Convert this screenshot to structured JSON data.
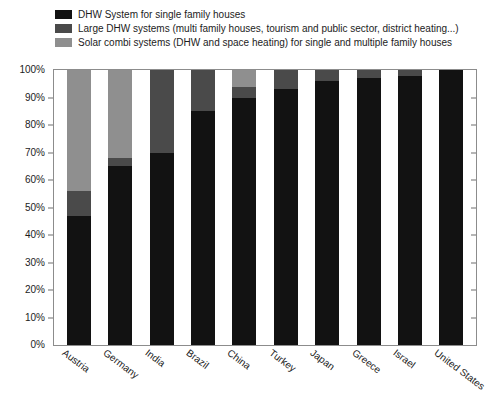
{
  "chart_data": {
    "type": "bar",
    "stacked": true,
    "title": "",
    "subtitle": "",
    "xlabel": "",
    "ylabel": "",
    "ylim": [
      0,
      100
    ],
    "yticks": [
      "0%",
      "10%",
      "20%",
      "30%",
      "40%",
      "50%",
      "60%",
      "70%",
      "80%",
      "90%",
      "100%"
    ],
    "ytick_values": [
      0,
      10,
      20,
      30,
      40,
      50,
      60,
      70,
      80,
      90,
      100
    ],
    "grid": false,
    "legend_position": "top",
    "categories": [
      "Austria",
      "Germany",
      "India",
      "Brazil",
      "China",
      "Turkey",
      "Japan",
      "Greece",
      "Israel",
      "United States"
    ],
    "series": [
      {
        "name": "DHW System for single family houses",
        "color": "#121212",
        "values": [
          47,
          65,
          70,
          85,
          90,
          93,
          96,
          97,
          98,
          100
        ]
      },
      {
        "name": "Large DHW systems (multi family houses, tourism and public sector, district heating...)",
        "color": "#4a4a4a",
        "values": [
          9,
          3,
          30,
          15,
          4,
          7,
          4,
          3,
          2,
          0
        ]
      },
      {
        "name": "Solar combi systems (DHW and space heating) for single and multiple family houses",
        "color": "#8f8f8f",
        "values": [
          44,
          32,
          0,
          0,
          6,
          0,
          0,
          0,
          0,
          0
        ]
      }
    ]
  },
  "legend": {
    "items": [
      {
        "label": "DHW System for single family houses",
        "color": "#121212"
      },
      {
        "label": "Large DHW systems (multi family houses, tourism and public sector, district heating...)",
        "color": "#4a4a4a"
      },
      {
        "label": "Solar combi systems (DHW and space heating) for single and multiple family houses",
        "color": "#8f8f8f"
      }
    ]
  },
  "axis": {
    "frame_color": "#8c8c8c",
    "tick_color": "#6f6f6f"
  }
}
